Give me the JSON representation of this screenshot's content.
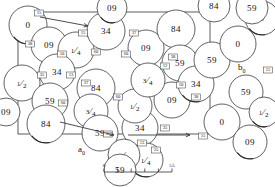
{
  "figure": {
    "type": "crystal-structure-packing-diagram",
    "title": "",
    "unit_cell": {
      "x": 18,
      "y": 12,
      "width": 192,
      "height": 122,
      "axes": [
        {
          "name": "a0",
          "label": "a",
          "subscript": "0",
          "label_x": 78,
          "label_y": 152,
          "direction": "down-left"
        },
        {
          "name": "b0",
          "label": "b",
          "subscript": "0",
          "label_x": 238,
          "label_y": 70,
          "direction": "right"
        }
      ]
    },
    "scale_bar": {
      "x": 104,
      "y": 172,
      "width": 68,
      "ticks": 5,
      "left_label": "0",
      "right_label": "5Å"
    },
    "atoms": [
      {
        "label": "0",
        "cx": 28,
        "cy": 25,
        "r": 19
      },
      {
        "label": "09",
        "cx": 49,
        "cy": 45,
        "r": 18
      },
      {
        "label": "1/4",
        "cx": 76,
        "cy": 50,
        "r": 18
      },
      {
        "label": "34",
        "cx": 106,
        "cy": 31,
        "r": 19
      },
      {
        "label": "09",
        "cx": 112,
        "cy": 8,
        "r": 15
      },
      {
        "label": "34",
        "cx": 57,
        "cy": 72,
        "r": 18
      },
      {
        "label": "1/2",
        "cx": 22,
        "cy": 83,
        "r": 18
      },
      {
        "label": "59",
        "cx": 50,
        "cy": 101,
        "r": 18
      },
      {
        "label": "84",
        "cx": 46,
        "cy": 124,
        "r": 19
      },
      {
        "label": "84",
        "cx": 96,
        "cy": 88,
        "r": 19
      },
      {
        "label": "3/4",
        "cx": 91,
        "cy": 111,
        "r": 17
      },
      {
        "label": "59",
        "cx": 100,
        "cy": 133,
        "r": 18
      },
      {
        "label": "34",
        "cx": 140,
        "cy": 128,
        "r": 18
      },
      {
        "label": "1/2",
        "cx": 135,
        "cy": 106,
        "r": 17
      },
      {
        "label": "09",
        "cx": 146,
        "cy": 48,
        "r": 18
      },
      {
        "label": "09",
        "cx": 172,
        "cy": 100,
        "r": 18
      },
      {
        "label": "1/4",
        "cx": 146,
        "cy": 160,
        "r": 17
      },
      {
        "label": "84",
        "cx": 176,
        "cy": 29,
        "r": 19
      },
      {
        "label": "3/4",
        "cx": 148,
        "cy": 80,
        "r": 17
      },
      {
        "label": "59",
        "cx": 180,
        "cy": 63,
        "r": 18
      },
      {
        "label": "34",
        "cx": 196,
        "cy": 84,
        "r": 18
      },
      {
        "label": "59",
        "cx": 212,
        "cy": 60,
        "r": 18
      },
      {
        "label": "0",
        "cx": 238,
        "cy": 44,
        "r": 18
      },
      {
        "label": "0",
        "cx": 222,
        "cy": 122,
        "r": 18
      },
      {
        "label": "09",
        "cx": 250,
        "cy": 142,
        "r": 17
      },
      {
        "label": "59",
        "cx": 246,
        "cy": 92,
        "r": 17
      },
      {
        "label": "1/4",
        "cx": 124,
        "cy": 155,
        "r": 16
      },
      {
        "label": "59",
        "cx": 120,
        "cy": 170,
        "r": 16
      },
      {
        "label": "0",
        "cx": 262,
        "cy": 18,
        "r": 17
      },
      {
        "label": "84",
        "cx": 214,
        "cy": 6,
        "r": 16
      },
      {
        "label": "59",
        "cx": 252,
        "cy": 8,
        "r": 16
      },
      {
        "label": "09",
        "cx": 6,
        "cy": 112,
        "r": 14
      },
      {
        "label": "1/2",
        "cx": 264,
        "cy": 112,
        "r": 15
      }
    ],
    "bond_labels": [
      {
        "value": "15",
        "x": 39,
        "y": 13
      },
      {
        "value": "38",
        "x": 30,
        "y": 44
      },
      {
        "value": "15",
        "x": 83,
        "y": 33
      },
      {
        "value": "10",
        "x": 62,
        "y": 54
      },
      {
        "value": "13",
        "x": 71,
        "y": 75
      },
      {
        "value": "35",
        "x": 42,
        "y": 75
      },
      {
        "value": "60",
        "x": 96,
        "y": 52
      },
      {
        "value": "37",
        "x": 86,
        "y": 83
      },
      {
        "value": "37",
        "x": 134,
        "y": 33
      },
      {
        "value": "60",
        "x": 126,
        "y": 54
      },
      {
        "value": "38",
        "x": 173,
        "y": 57
      },
      {
        "value": "60",
        "x": 63,
        "y": 103
      },
      {
        "value": "60",
        "x": 118,
        "y": 97
      },
      {
        "value": "12",
        "x": 165,
        "y": 66
      },
      {
        "value": "35",
        "x": 165,
        "y": 128
      },
      {
        "value": "13",
        "x": 142,
        "y": 143
      },
      {
        "value": "15",
        "x": 203,
        "y": 136
      },
      {
        "value": "10",
        "x": 181,
        "y": 85
      },
      {
        "value": "38",
        "x": 196,
        "y": 97
      },
      {
        "value": "35",
        "x": 108,
        "y": 134
      },
      {
        "value": "55",
        "x": 156,
        "y": 150
      },
      {
        "value": "15",
        "x": 268,
        "y": 70
      }
    ],
    "accent_color": "#3a3a3a",
    "background_color": "#ffffff"
  }
}
